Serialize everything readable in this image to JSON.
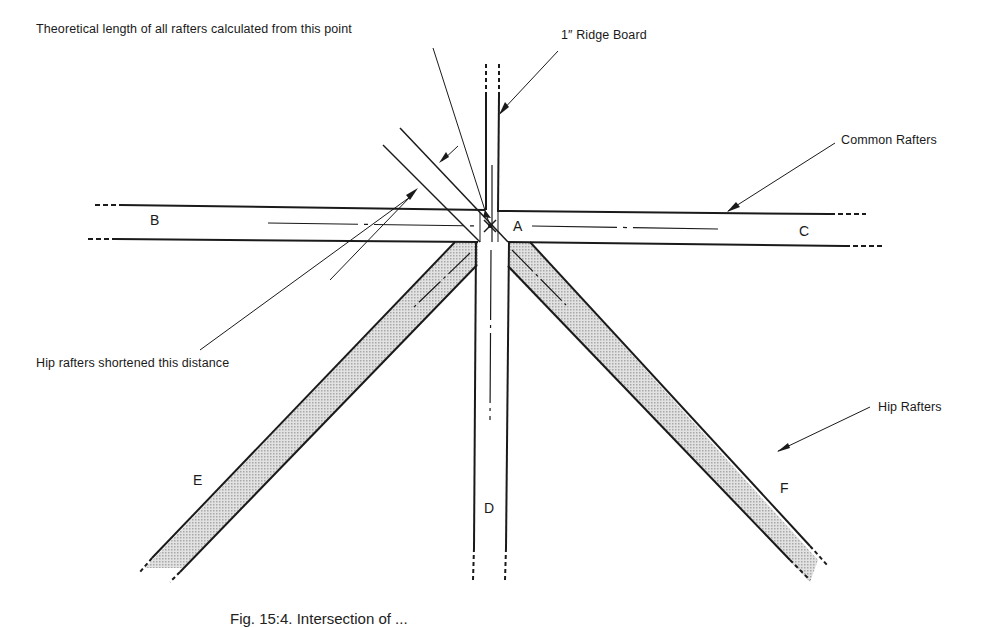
{
  "figure": {
    "callouts": {
      "theoretical_length": "Theoretical length of all rafters calculated from this point",
      "ridge_board": "1″ Ridge Board",
      "common_rafters": "Common Rafters",
      "hip_shortened": "Hip rafters shortened this distance",
      "hip_rafters": "Hip Rafters"
    },
    "letters": {
      "a": "A",
      "b": "B",
      "c": "C",
      "d": "D",
      "e": "E",
      "f": "F"
    },
    "caption": "Fig. 15:4. Intersection of ...",
    "colors": {
      "line": "#1a1a1a",
      "hip_fill": "#cfcfcf",
      "background": "#ffffff"
    }
  }
}
